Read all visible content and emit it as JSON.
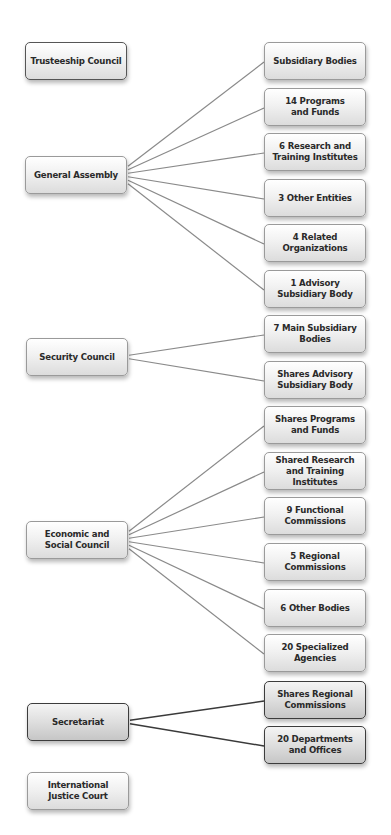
{
  "diagram": {
    "colors": {
      "box_border": "#9a9a9a",
      "box_border_dark": "#3c3c3c",
      "line_light": "#8a8a8a",
      "line_dark": "#3a3a3a",
      "text": "#2a2a2a"
    },
    "left_nodes": [
      {
        "id": "trusteeship",
        "label": "Trusteeship Council",
        "x": 25,
        "y": 42,
        "style": "mid"
      },
      {
        "id": "general-assembly",
        "label": "General Assembly",
        "x": 25,
        "y": 156,
        "style": "light"
      },
      {
        "id": "security-council",
        "label": "Security Council",
        "x": 26,
        "y": 338,
        "style": "light"
      },
      {
        "id": "ecosoc",
        "label": "Economic and\nSocial Council",
        "x": 26,
        "y": 521,
        "style": "light"
      },
      {
        "id": "secretariat",
        "label": "Secretariat",
        "x": 27,
        "y": 703,
        "style": "dark"
      },
      {
        "id": "icj",
        "label": "International\nJustice Court",
        "x": 27,
        "y": 772,
        "style": "light"
      }
    ],
    "right_nodes": [
      {
        "id": "r1",
        "label": "Subsidiary Bodies",
        "y": 42,
        "parent": "general-assembly",
        "style": "light"
      },
      {
        "id": "r2",
        "label": "14 Programs\nand Funds",
        "y": 88,
        "parent": "general-assembly",
        "style": "light"
      },
      {
        "id": "r3",
        "label": "6 Research and\nTraining Institutes",
        "y": 133,
        "parent": "general-assembly",
        "style": "light"
      },
      {
        "id": "r4",
        "label": "3 Other Entities",
        "y": 179,
        "parent": "general-assembly",
        "style": "light"
      },
      {
        "id": "r5",
        "label": "4 Related\nOrganizations",
        "y": 224,
        "parent": "general-assembly",
        "style": "light"
      },
      {
        "id": "r6",
        "label": "1 Advisory\nSubsidiary Body",
        "y": 270,
        "parent": "general-assembly",
        "style": "light"
      },
      {
        "id": "r7",
        "label": "7 Main Subsidiary\nBodies",
        "y": 315,
        "parent": "security-council",
        "style": "light"
      },
      {
        "id": "r8",
        "label": "Shares Advisory\nSubsidiary Body",
        "y": 361,
        "parent": "security-council",
        "style": "light"
      },
      {
        "id": "r9",
        "label": "Shares Programs\nand Funds",
        "y": 406,
        "parent": "ecosoc",
        "style": "light"
      },
      {
        "id": "r10",
        "label": "Shared Research\nand Training\nInstitutes",
        "y": 452,
        "parent": "ecosoc",
        "style": "light"
      },
      {
        "id": "r11",
        "label": "9 Functional\nCommissions",
        "y": 497,
        "parent": "ecosoc",
        "style": "light"
      },
      {
        "id": "r12",
        "label": "5 Regional\nCommissions",
        "y": 543,
        "parent": "ecosoc",
        "style": "light"
      },
      {
        "id": "r13",
        "label": "6 Other Bodies",
        "y": 589,
        "parent": "ecosoc",
        "style": "light"
      },
      {
        "id": "r14",
        "label": "20 Specialized\nAgencies",
        "y": 634,
        "parent": "ecosoc",
        "style": "light"
      },
      {
        "id": "r15",
        "label": "Shares Regional\nCommissions",
        "y": 681,
        "parent": "secretariat",
        "style": "dark"
      },
      {
        "id": "r16",
        "label": "20 Departments\nand Offices",
        "y": 726,
        "parent": "secretariat",
        "style": "dark"
      }
    ],
    "right_x": 264
  }
}
